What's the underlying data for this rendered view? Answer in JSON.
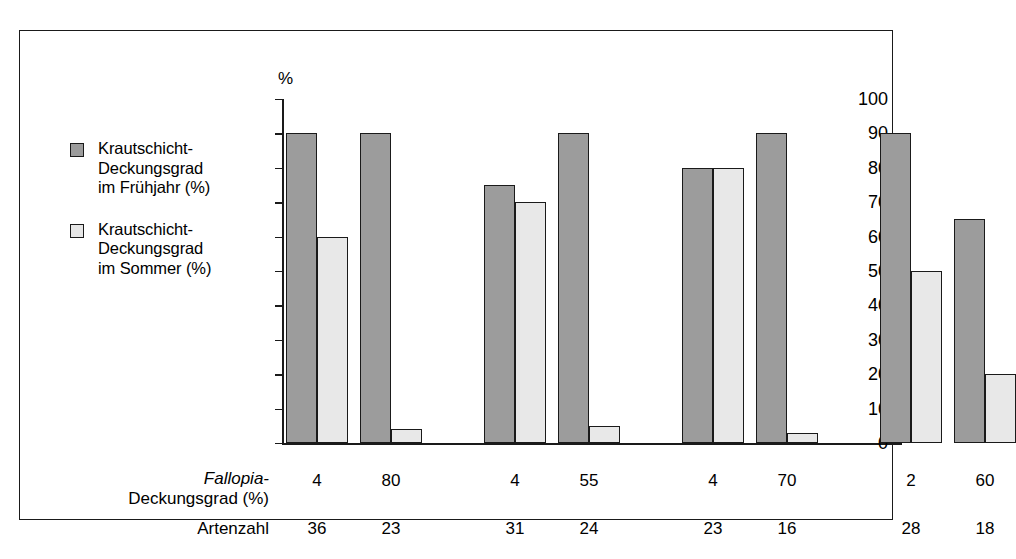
{
  "chart_data": {
    "type": "bar",
    "title": "",
    "xlabel": "",
    "ylabel": "%",
    "ylim": [
      0,
      100
    ],
    "ytick_step": 10,
    "yticks": [
      100,
      90,
      80,
      70,
      60,
      50,
      40,
      30,
      20,
      10,
      0
    ],
    "grid": false,
    "legend_position": "left",
    "categories": [
      "1",
      "2",
      "3",
      "4",
      "5",
      "6",
      "7",
      "8"
    ],
    "groups": [
      [
        1,
        2
      ],
      [
        3,
        4
      ],
      [
        5,
        6
      ],
      [
        7,
        8
      ]
    ],
    "series": [
      {
        "name": "Krautschicht-Deckungsgrad im Frühjahr (%)",
        "color": "#9c9c9c",
        "values": [
          90,
          90,
          75,
          90,
          80,
          90,
          90,
          65
        ]
      },
      {
        "name": "Krautschicht-Deckungsgrad im Sommer (%)",
        "color": "#e8e8e8",
        "values": [
          60,
          4,
          70,
          5,
          80,
          3,
          50,
          20
        ]
      }
    ],
    "annotation_rows": [
      {
        "label_italic": "Fallopia-",
        "label_rest": "Deckungsgrad (%)",
        "values": [
          "4",
          "80",
          "4",
          "55",
          "4",
          "70",
          "2",
          "60"
        ]
      },
      {
        "label_italic": "",
        "label_rest": "Artenzahl",
        "values": [
          "36",
          "23",
          "31",
          "24",
          "23",
          "16",
          "28",
          "18"
        ]
      }
    ]
  },
  "legend": {
    "entries": [
      {
        "swatch": "dark",
        "label": "Krautschicht-\nDeckungsgrad\nim Frühjahr (%)"
      },
      {
        "swatch": "light",
        "label": "Krautschicht-\nDeckungsgrad\nim Sommer (%)"
      }
    ]
  },
  "axis": {
    "unit_label": "%",
    "tick_labels": [
      "100",
      "90",
      "80",
      "70",
      "60",
      "50",
      "40",
      "30",
      "20",
      "10",
      "0"
    ]
  },
  "colors": {
    "dark_bar": "#9c9c9c",
    "light_bar": "#e8e8e8",
    "outline": "#1a1a1a",
    "background": "#ffffff"
  }
}
